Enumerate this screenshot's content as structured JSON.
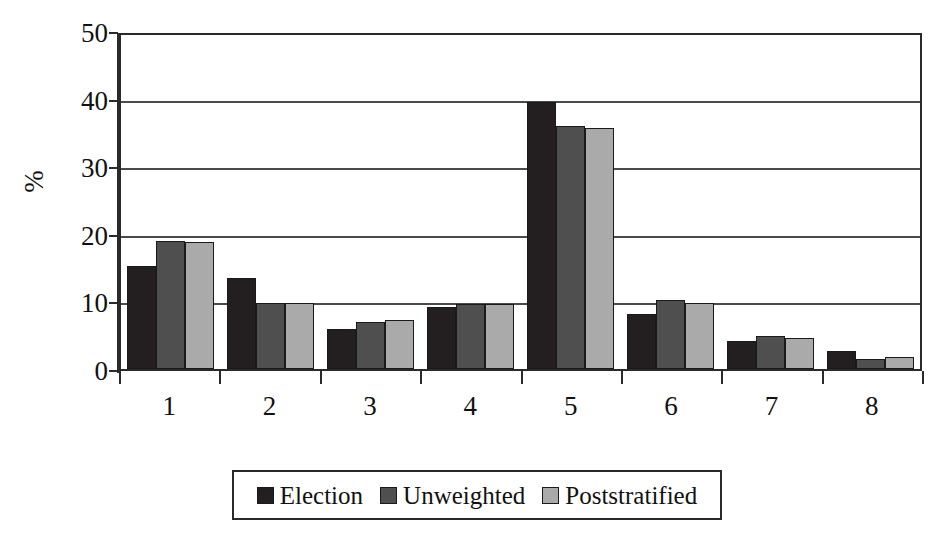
{
  "chart_data": {
    "type": "bar",
    "title": "",
    "subtitle": "",
    "xlabel": "",
    "ylabel": "%",
    "categories": [
      "1",
      "2",
      "3",
      "4",
      "5",
      "6",
      "7",
      "8"
    ],
    "series": [
      {
        "name": "Election",
        "color": "#231f20",
        "values": [
          15.3,
          13.5,
          5.9,
          9.1,
          39.5,
          8.1,
          4.2,
          2.7
        ]
      },
      {
        "name": "Unweighted",
        "color": "#4f4f4f",
        "values": [
          18.9,
          9.8,
          6.9,
          9.6,
          36.0,
          10.2,
          4.9,
          1.5
        ]
      },
      {
        "name": "Poststratified",
        "color": "#aaaaaa",
        "values": [
          18.8,
          9.8,
          7.3,
          9.6,
          35.7,
          9.8,
          4.6,
          1.8
        ]
      }
    ],
    "ylim": [
      0,
      50
    ],
    "ytick_values": [
      0,
      10,
      20,
      30,
      40,
      50
    ],
    "ytick_labels": [
      "0",
      "10",
      "20",
      "30",
      "40",
      "50"
    ],
    "grid": true,
    "grid_axis": "y",
    "legend_position": "bottom-center",
    "bar_group_count": 8,
    "series_count": 3,
    "annotations": []
  },
  "legend": {
    "items": [
      {
        "label": "Election"
      },
      {
        "label": "Unweighted"
      },
      {
        "label": "Poststratified"
      }
    ]
  },
  "colors": {
    "series_election": "#231f20",
    "series_unweighted": "#4f4f4f",
    "series_poststratified": "#aaaaaa",
    "axis": "#2a2a2a",
    "grid": "#4a4a4a",
    "background": "#ffffff"
  }
}
